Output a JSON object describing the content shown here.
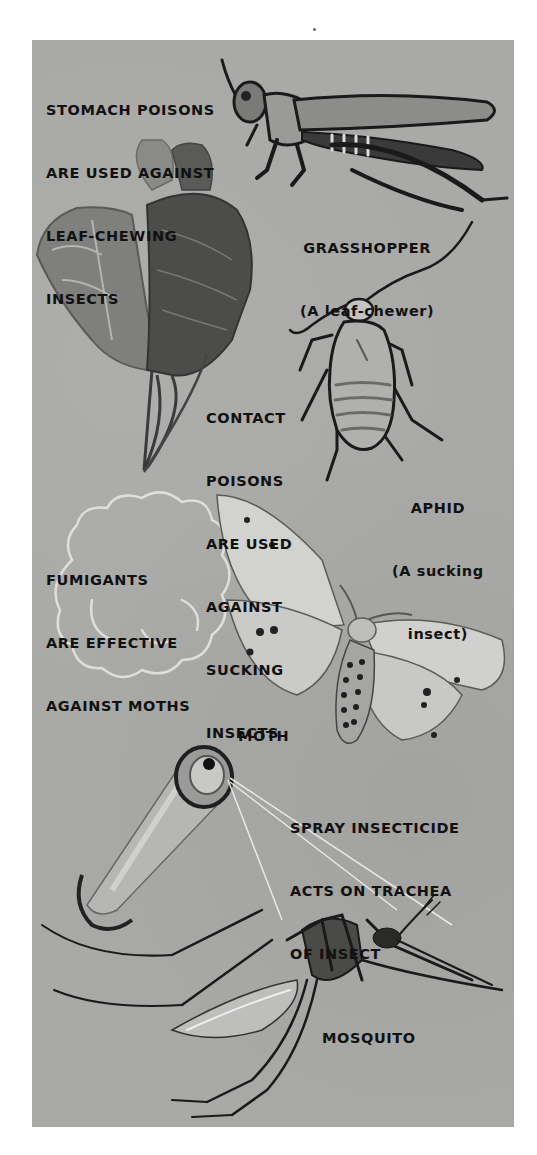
{
  "illustration": {
    "title": "Insecticide types and the insects they act on",
    "background_color": "#a9a9a7",
    "sections": [
      {
        "id": "stomach-poisons",
        "caption_lines": [
          "STOMACH POISONS",
          "ARE USED AGAINST",
          "LEAF-CHEWING",
          "INSECTS"
        ],
        "insect": {
          "name": "GRASSHOPPER",
          "note": "(A leaf-chewer)"
        }
      },
      {
        "id": "contact-poisons",
        "caption_lines": [
          "CONTACT",
          "POISONS",
          "ARE USED",
          "AGAINST",
          "SUCKING",
          "INSECTS"
        ],
        "insect": {
          "name": "APHID",
          "note_lines": [
            "(A sucking",
            "insect)"
          ]
        }
      },
      {
        "id": "fumigants",
        "caption_lines": [
          "FUMIGANTS",
          "ARE EFFECTIVE",
          "AGAINST MOTHS"
        ],
        "insect": {
          "name": "MOTH"
        }
      },
      {
        "id": "spray-insecticide",
        "caption_lines": [
          "SPRAY INSECTICIDE",
          "ACTS ON TRACHEA",
          "OF INSECT"
        ],
        "insect": {
          "name": "MOSQUITO"
        }
      }
    ]
  }
}
